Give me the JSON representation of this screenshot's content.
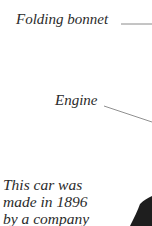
{
  "labels": {
    "folding_bonnet": "Folding bonnet",
    "engine": "Engine"
  },
  "body_text": {
    "lines": [
      "This car was",
      "made in 1896",
      "by a company"
    ]
  },
  "colors": {
    "text": "#2b2b2b",
    "leader_line": "#8a8a8a",
    "car_body": "#1e1e1e"
  }
}
